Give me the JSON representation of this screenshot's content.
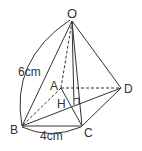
{
  "diagram": {
    "type": "square pyramid",
    "vertices": {
      "O": "O",
      "A": "A",
      "B": "B",
      "C": "C",
      "D": "D",
      "H": "H"
    },
    "labels": {
      "edge_OB": "6cm",
      "edge_BC": "4cm"
    }
  }
}
